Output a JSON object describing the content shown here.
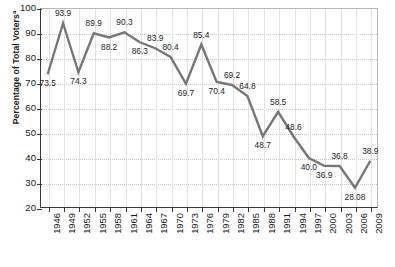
{
  "chart_data": {
    "type": "line",
    "title": "",
    "xlabel": "",
    "ylabel": "Percentage of Total Voters",
    "ylabel_superscript": "a",
    "ylim": [
      20,
      100
    ],
    "yticks": [
      100,
      90,
      80,
      70,
      60,
      50,
      40,
      30,
      20
    ],
    "ytick_labels": [
      "100",
      "90",
      "80",
      "70",
      "60",
      "50",
      "40",
      "30",
      "20"
    ],
    "grid": true,
    "legend": null,
    "categories": [
      "1946",
      "1949",
      "1952",
      "1955",
      "1958",
      "1961",
      "1964",
      "1967",
      "1970",
      "1973",
      "1976",
      "1979",
      "1982",
      "1985",
      "1988",
      "1991",
      "1994",
      "1997",
      "2000",
      "2003",
      "2006",
      "2009"
    ],
    "values": [
      73.5,
      93.9,
      74.3,
      89.9,
      88.2,
      90.3,
      86.3,
      83.9,
      80.4,
      69.7,
      85.4,
      70.4,
      69.2,
      64.8,
      48.7,
      58.5,
      48.6,
      40.0,
      36.9,
      36.8,
      28.08,
      38.9
    ],
    "data_labels": [
      "73.5",
      "93.9",
      "74.3",
      "89.9",
      "88.2",
      "90.3",
      "86.3",
      "83.9",
      "80.4",
      "69.7",
      "85.4",
      "70.4",
      "69.2",
      "64.8",
      "48.7",
      "58.5",
      "48.6",
      "40.0",
      "36.9",
      "36.8",
      "28.08",
      "38.9"
    ],
    "label_positions": [
      "below",
      "above",
      "below",
      "above",
      "below",
      "above",
      "below",
      "above",
      "above",
      "below",
      "above",
      "below",
      "above",
      "above",
      "below",
      "above",
      "above",
      "below",
      "below",
      "above",
      "below",
      "above"
    ],
    "line_color": "#777777",
    "axis_color": "#3a3a3a",
    "grid_color": "#e2e2e2",
    "background_color": "#ffffff"
  }
}
